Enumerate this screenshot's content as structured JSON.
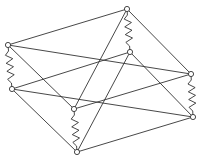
{
  "diagram": {
    "type": "tensegrity-structure",
    "nodes": [
      {
        "id": "A",
        "x": 8,
        "y": 45
      },
      {
        "id": "B",
        "x": 12,
        "y": 89
      },
      {
        "id": "C",
        "x": 127,
        "y": 9
      },
      {
        "id": "D",
        "x": 130,
        "y": 52
      },
      {
        "id": "E",
        "x": 191,
        "y": 74
      },
      {
        "id": "F",
        "x": 193,
        "y": 117
      },
      {
        "id": "G",
        "x": 74,
        "y": 109
      },
      {
        "id": "H",
        "x": 77,
        "y": 152
      }
    ],
    "lines": [
      [
        "A",
        "C"
      ],
      [
        "A",
        "E"
      ],
      [
        "A",
        "G"
      ],
      [
        "B",
        "D"
      ],
      [
        "B",
        "F"
      ],
      [
        "B",
        "H"
      ],
      [
        "C",
        "E"
      ],
      [
        "C",
        "G"
      ],
      [
        "D",
        "H"
      ],
      [
        "D",
        "F"
      ],
      [
        "G",
        "E"
      ],
      [
        "H",
        "F"
      ]
    ],
    "springs": [
      [
        "A",
        "B"
      ],
      [
        "C",
        "D"
      ],
      [
        "E",
        "F"
      ],
      [
        "G",
        "H"
      ]
    ],
    "colors": {
      "stroke": "#333333",
      "node_fill": "#ffffff",
      "background": "#ffffff"
    }
  }
}
